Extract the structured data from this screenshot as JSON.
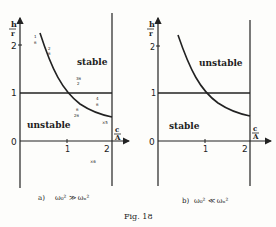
{
  "figure": {
    "caption": "Fig. 18"
  },
  "panels": [
    {
      "id": "a",
      "caption_label": "a)",
      "caption_condition": "ω₀² ≫ ωₙ²",
      "y_axis_label_top": "h",
      "y_axis_label_bottom": "r",
      "x_axis_label_top": "c",
      "x_axis_label_bottom": "A",
      "y_ticks": [
        "2",
        "1",
        "0"
      ],
      "x_ticks": [
        "1",
        "2"
      ],
      "region_above": "stable",
      "region_below": "unstable",
      "annotations": [
        {
          "text_top": "1",
          "text_bottom": "π"
        },
        {
          "text_top": "2",
          "text_bottom": "π"
        },
        {
          "text_top": "3π",
          "text_bottom": "2"
        },
        {
          "text_top": "4",
          "text_bottom": "π"
        },
        {
          "text_top": "π",
          "text_bottom": "2π"
        },
        {
          "text": "×5"
        },
        {
          "text": "×6"
        }
      ]
    },
    {
      "id": "b",
      "caption_label": "b)",
      "caption_condition": "ω₀² ≪ ωₙ²",
      "y_axis_label_top": "h",
      "y_axis_label_bottom": "r",
      "x_axis_label_top": "c",
      "x_axis_label_bottom": "A",
      "y_ticks": [
        "2",
        "1",
        "0"
      ],
      "x_ticks": [
        "1",
        "2"
      ],
      "region_above": "unstable",
      "region_below": "stable"
    }
  ]
}
